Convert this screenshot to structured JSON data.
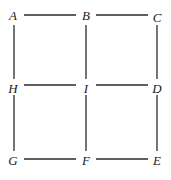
{
  "diagram": {
    "nodes": [
      {
        "id": "A",
        "label": "A",
        "x": 13,
        "y": 16
      },
      {
        "id": "B",
        "label": "B",
        "x": 86,
        "y": 16
      },
      {
        "id": "C",
        "label": "C",
        "x": 157,
        "y": 18
      },
      {
        "id": "H",
        "label": "H",
        "x": 13,
        "y": 89
      },
      {
        "id": "I",
        "label": "I",
        "x": 86,
        "y": 89
      },
      {
        "id": "D",
        "label": "D",
        "x": 157,
        "y": 89
      },
      {
        "id": "G",
        "label": "G",
        "x": 13,
        "y": 161
      },
      {
        "id": "F",
        "label": "F",
        "x": 86,
        "y": 161
      },
      {
        "id": "E",
        "label": "E",
        "x": 157,
        "y": 161
      }
    ],
    "edges": [
      {
        "from": "A",
        "to": "B",
        "x1": 24,
        "y1": 15,
        "x2": 76,
        "y2": 15
      },
      {
        "from": "B",
        "to": "C",
        "x1": 96,
        "y1": 15,
        "x2": 148,
        "y2": 15
      },
      {
        "from": "A",
        "to": "H",
        "x1": 14,
        "y1": 25,
        "x2": 14,
        "y2": 79
      },
      {
        "from": "B",
        "to": "I",
        "x1": 86,
        "y1": 25,
        "x2": 86,
        "y2": 79
      },
      {
        "from": "C",
        "to": "D",
        "x1": 157,
        "y1": 25,
        "x2": 157,
        "y2": 79
      },
      {
        "from": "H",
        "to": "I",
        "x1": 24,
        "y1": 85,
        "x2": 76,
        "y2": 85
      },
      {
        "from": "I",
        "to": "D",
        "x1": 96,
        "y1": 85,
        "x2": 148,
        "y2": 85
      },
      {
        "from": "H",
        "to": "G",
        "x1": 14,
        "y1": 95,
        "x2": 14,
        "y2": 151
      },
      {
        "from": "I",
        "to": "F",
        "x1": 86,
        "y1": 95,
        "x2": 86,
        "y2": 151
      },
      {
        "from": "D",
        "to": "E",
        "x1": 157,
        "y1": 95,
        "x2": 157,
        "y2": 151
      },
      {
        "from": "G",
        "to": "F",
        "x1": 24,
        "y1": 159,
        "x2": 76,
        "y2": 159
      },
      {
        "from": "F",
        "to": "E",
        "x1": 96,
        "y1": 159,
        "x2": 148,
        "y2": 159
      }
    ]
  }
}
